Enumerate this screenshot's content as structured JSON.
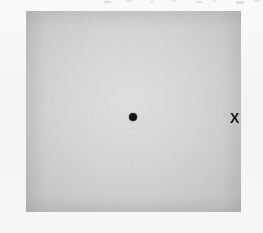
{
  "figure": {
    "caption": "",
    "background_color": "#f6f6f4",
    "margin_color": "#fafaf9"
  },
  "stimulus": {
    "name": "gray-square-patch",
    "shape": "square",
    "left_px": 26,
    "top_px": 11,
    "width_px": 215,
    "height_px": 201,
    "gradient": {
      "type": "radial",
      "center_x_pct": 48,
      "center_y_pct": 44,
      "center_color": "#e2e2e1",
      "edge_color": "#b2b2b1"
    }
  },
  "markers": [
    {
      "name": "fixation-dot",
      "glyph": "dot-icon",
      "label": "●",
      "x_px": 133,
      "y_px": 117,
      "diameter_px": 8,
      "color": "#121212"
    },
    {
      "name": "target-marker",
      "glyph": "x-mark-icon",
      "label": "X",
      "x_px": 236,
      "y_px": 118,
      "font_size_px": 14,
      "color": "#161616"
    }
  ],
  "annotations": {
    "top_edge_specks": "faint scan artifacts clipped from the text line above"
  }
}
